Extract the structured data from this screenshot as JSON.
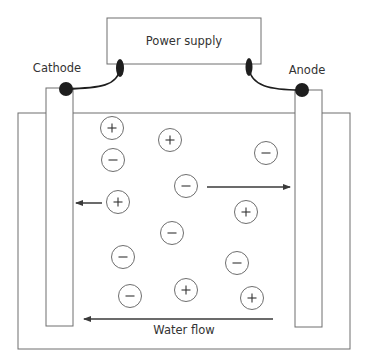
{
  "header": {
    "truncated_text": "ELECTROKINETIC REMEDIATION OF SOILS"
  },
  "power_supply": {
    "label": "Power supply"
  },
  "electrodes": {
    "cathode_label": "Cathode",
    "anode_label": "Anode"
  },
  "flow": {
    "label": "Water flow"
  },
  "ions": [
    {
      "charge": "+",
      "x": 112,
      "y": 128
    },
    {
      "charge": "+",
      "x": 170,
      "y": 140
    },
    {
      "charge": "-",
      "x": 113,
      "y": 160
    },
    {
      "charge": "-",
      "x": 266,
      "y": 153
    },
    {
      "charge": "-",
      "x": 186,
      "y": 186
    },
    {
      "charge": "+",
      "x": 118,
      "y": 202
    },
    {
      "charge": "+",
      "x": 246,
      "y": 212
    },
    {
      "charge": "-",
      "x": 172,
      "y": 233
    },
    {
      "charge": "-",
      "x": 123,
      "y": 257
    },
    {
      "charge": "-",
      "x": 237,
      "y": 263
    },
    {
      "charge": "-",
      "x": 130,
      "y": 296
    },
    {
      "charge": "+",
      "x": 186,
      "y": 290
    },
    {
      "charge": "+",
      "x": 252,
      "y": 298
    }
  ],
  "arrows": [
    {
      "name": "cation-migration-arrow",
      "direction": "left",
      "x1": 102,
      "x2": 76,
      "y": 203
    },
    {
      "name": "anion-migration-arrow",
      "direction": "right",
      "x1": 207,
      "x2": 290,
      "y": 187
    },
    {
      "name": "water-flow-arrow",
      "direction": "left",
      "x1": 273,
      "x2": 84,
      "y": 319
    }
  ],
  "colors": {
    "line": "#6e6e6e",
    "dark": "#1e1e1e",
    "text": "#333333",
    "background": "#ffffff"
  }
}
